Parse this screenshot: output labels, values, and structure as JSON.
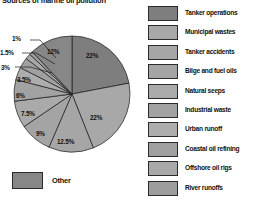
{
  "chart_data": {
    "type": "pie",
    "title": "Sources of marine oil pollution",
    "xlabel": "",
    "ylabel": "",
    "legend_position": "right",
    "grid": false,
    "categories": [
      "Tanker operations",
      "Municipal wastes",
      "Tanker accidents",
      "Bilge and fuel oils",
      "Natural seeps",
      "Industrial waste",
      "Urban runoff",
      "Coastal oil refining",
      "Offshore oil rigs",
      "River runoffs",
      "Other"
    ],
    "values": [
      22,
      22,
      12.5,
      9,
      7.5,
      6,
      3.5,
      3,
      1.5,
      1,
      12
    ],
    "value_labels": [
      "22%",
      "22%",
      "12.5%",
      "9%",
      "7.5%",
      "6%",
      "3.5%",
      "3%",
      "1.5%",
      "1%",
      "12%"
    ],
    "colors": [
      "#7e7e7e",
      "#a8a8a8",
      "#a6a6a6",
      "#a4a4a4",
      "#aaaaaa",
      "#a2a2a2",
      "#adadad",
      "#a0a0a0",
      "#a9a9a9",
      "#9d9d9d",
      "#878787"
    ],
    "units": "percent"
  },
  "title": "Sources of marine oil pollution",
  "other_key": {
    "label": "Other",
    "color": "#878787"
  },
  "legend": {
    "items": [
      {
        "label": "Tanker operations",
        "color": "#7e7e7e"
      },
      {
        "label": "Municipal wastes",
        "color": "#a8a8a8"
      },
      {
        "label": "Tanker accidents",
        "color": "#a6a6a6"
      },
      {
        "label": "Bilge and fuel oils",
        "color": "#a4a4a4"
      },
      {
        "label": "Natural seeps",
        "color": "#aaaaaa"
      },
      {
        "label": "Industrial waste",
        "color": "#a2a2a2"
      },
      {
        "label": "Urban runoff",
        "color": "#adadad"
      },
      {
        "label": "Coastal oil refining",
        "color": "#a0a0a0"
      },
      {
        "label": "Offshore oil rigs",
        "color": "#a9a9a9"
      },
      {
        "label": "River runoffs",
        "color": "#9d9d9d"
      }
    ]
  },
  "slice_labels": [
    {
      "text": "22%",
      "x": 86,
      "y": 34
    },
    {
      "text": "22%",
      "x": 90,
      "y": 96
    },
    {
      "text": "12.5%",
      "x": 57,
      "y": 120
    },
    {
      "text": "9%",
      "x": 36,
      "y": 112
    },
    {
      "text": "7.5%",
      "x": 21,
      "y": 92
    },
    {
      "text": "6%",
      "x": 16,
      "y": 74
    },
    {
      "text": "3.5%",
      "x": 17,
      "y": 58
    },
    {
      "text": "3%",
      "x": 1,
      "y": 46
    },
    {
      "text": "1.5%",
      "x": 0,
      "y": 31
    },
    {
      "text": "1%",
      "x": 12,
      "y": 17
    },
    {
      "text": "12%",
      "x": 47,
      "y": 30
    }
  ]
}
